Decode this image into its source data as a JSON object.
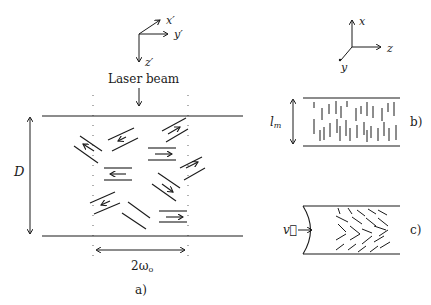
{
  "figure": {
    "panel_a": {
      "caption": "a)",
      "axes": {
        "x": "x′",
        "y": "y′",
        "z": "z′"
      },
      "beam_label": "Laser beam",
      "thickness_label": "D",
      "beam_width_label": "2ω",
      "beam_width_sub": "o",
      "molecule_pairs": 11
    },
    "panel_b": {
      "caption": "b)",
      "layer_label": "l",
      "layer_sub": "m"
    },
    "panel_c": {
      "caption": "c)",
      "velocity_label": "v⃗"
    },
    "lab_axes": {
      "x": "x",
      "y": "y",
      "z": "z"
    },
    "colors": {
      "ink": "#1a1a1a",
      "background": "#ffffff"
    }
  }
}
